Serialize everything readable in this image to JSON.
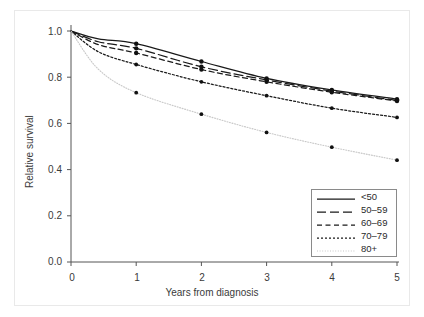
{
  "chart_data": {
    "type": "line",
    "title": "",
    "xlabel": "Years from diagnosis",
    "ylabel": "Relative survival",
    "xlim": [
      0,
      5
    ],
    "ylim": [
      0,
      1.0
    ],
    "xticks": [
      "0",
      "1",
      "2",
      "3",
      "4",
      "5"
    ],
    "yticks": [
      "0.0",
      "0.2",
      "0.4",
      "0.6",
      "0.8",
      "1.0"
    ],
    "grid": false,
    "legend_position": "lower right",
    "x": [
      0,
      1,
      2,
      3,
      4,
      5
    ],
    "series": [
      {
        "name": "<50",
        "linestyle": "solid",
        "color": "#1a1a1a",
        "values": [
          1.0,
          0.945,
          0.868,
          0.795,
          0.745,
          0.705
        ],
        "points": [
          0.945,
          0.868,
          0.795,
          0.745,
          0.705
        ]
      },
      {
        "name": "50–59",
        "linestyle": "long-dash",
        "color": "#1a1a1a",
        "values": [
          1.0,
          0.925,
          0.845,
          0.788,
          0.74,
          0.7
        ],
        "points": [
          0.925,
          0.845,
          0.788,
          0.74,
          0.7
        ]
      },
      {
        "name": "60–69",
        "linestyle": "dash",
        "color": "#1a1a1a",
        "values": [
          1.0,
          0.905,
          0.833,
          0.78,
          0.735,
          0.697
        ],
        "points": [
          0.905,
          0.833,
          0.78,
          0.735,
          0.697
        ]
      },
      {
        "name": "70–79",
        "linestyle": "dotted",
        "color": "#1a1a1a",
        "values": [
          1.0,
          0.855,
          0.78,
          0.72,
          0.666,
          0.626
        ],
        "points": [
          0.855,
          0.78,
          0.72,
          0.666,
          0.626
        ]
      },
      {
        "name": "80+",
        "linestyle": "fine-dotted",
        "color": "#c8c8c8",
        "values": [
          1.0,
          0.733,
          0.64,
          0.561,
          0.497,
          0.441
        ],
        "points": [
          0.733,
          0.64,
          0.561,
          0.497,
          0.441
        ]
      }
    ]
  },
  "legend": {
    "entries": [
      {
        "label": "<50"
      },
      {
        "label": "50–59"
      },
      {
        "label": "60–69"
      },
      {
        "label": "70–79"
      },
      {
        "label": "80+"
      }
    ]
  },
  "axes": {
    "y_label": "Relative survival",
    "x_label": "Years from diagnosis",
    "y_ticks": [
      "1.0",
      "0.8",
      "0.6",
      "0.4",
      "0.2",
      "0.0"
    ],
    "x_ticks": [
      "0",
      "1",
      "2",
      "3",
      "4",
      "5"
    ]
  }
}
